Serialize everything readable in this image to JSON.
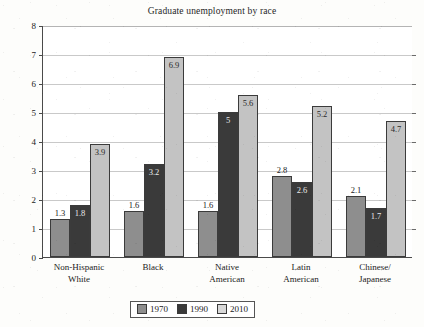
{
  "chart_data": {
    "type": "bar",
    "title": "Graduate unemployment by race",
    "xlabel": "",
    "ylabel": "",
    "ylim": [
      0,
      8
    ],
    "yticks": [
      0,
      1,
      2,
      3,
      4,
      5,
      6,
      7,
      8
    ],
    "grid": true,
    "legend_position": "bottom-center",
    "categories": [
      "Non-Hispanic\nWhite",
      "Black",
      "Native\nAmerican",
      "Latin\nAmerican",
      "Chinese/\nJapanese"
    ],
    "series": [
      {
        "name": "1970",
        "color": "#8e8e8e",
        "values": [
          1.3,
          1.6,
          1.6,
          2.8,
          2.1
        ]
      },
      {
        "name": "1990",
        "color": "#3a3a3a",
        "values": [
          1.8,
          3.2,
          5.0,
          2.6,
          1.7
        ]
      },
      {
        "name": "2010",
        "color": "#c3c3c3",
        "values": [
          3.9,
          6.9,
          5.6,
          5.2,
          4.7
        ]
      }
    ],
    "data_labels": [
      [
        "1.3",
        "1.8",
        "3.9"
      ],
      [
        "1.6",
        "3.2",
        "6.9"
      ],
      [
        "1.6",
        "5",
        "5.6"
      ],
      [
        "2.8",
        "2.6",
        "5.2"
      ],
      [
        "2.1",
        "1.7",
        "4.7"
      ]
    ]
  },
  "axis": {
    "y_tick_labels": [
      "8",
      "7",
      "6",
      "5",
      "4",
      "3",
      "2",
      "1",
      "0"
    ]
  },
  "x_axis": {
    "labels": [
      {
        "line1": "Non-Hispanic",
        "line2": "White"
      },
      {
        "line1": "Black",
        "line2": ""
      },
      {
        "line1": "Native",
        "line2": "American"
      },
      {
        "line1": "Latin",
        "line2": "American"
      },
      {
        "line1": "Chinese/",
        "line2": "Japanese"
      }
    ]
  },
  "legend": {
    "items": [
      {
        "label": "1970"
      },
      {
        "label": "1990"
      },
      {
        "label": "2010"
      }
    ]
  }
}
